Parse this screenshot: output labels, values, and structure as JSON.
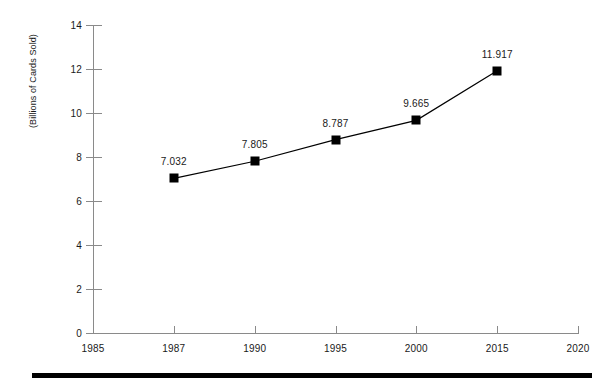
{
  "chart_data": {
    "type": "line",
    "title": "",
    "subtitle": "",
    "xlabel": "",
    "ylabel": "(Billions of Cards Sold)",
    "x_tick_labels": [
      "1985",
      "1987",
      "1990",
      "1995",
      "2000",
      "2015",
      "2020"
    ],
    "y_tick_labels": [
      "0",
      "2",
      "4",
      "6",
      "8",
      "10",
      "12",
      "14"
    ],
    "y_ticks": [
      0,
      2,
      4,
      6,
      8,
      10,
      12,
      14
    ],
    "ylim": [
      0,
      14
    ],
    "grid": false,
    "legend": null,
    "categories": [
      "1987",
      "1990",
      "1995",
      "2000",
      "2015"
    ],
    "values": [
      7.032,
      7.805,
      8.787,
      9.665,
      11.917
    ],
    "point_labels": [
      "7.032",
      "7.805",
      "8.787",
      "9.665",
      "11.917"
    ],
    "series": [
      {
        "name": "Cards Sold",
        "categories": [
          "1987",
          "1990",
          "1995",
          "2000",
          "2015"
        ],
        "values": [
          7.032,
          7.805,
          8.787,
          9.665,
          11.917
        ],
        "marker": "square",
        "marker_color": "#000000",
        "line_color": "#000000"
      }
    ],
    "annotations": [],
    "colors": {
      "axis": "#8a8a8a",
      "text": "#1a1a1a",
      "series": "#000000",
      "background": "#ffffff",
      "rule": "#000000"
    }
  }
}
